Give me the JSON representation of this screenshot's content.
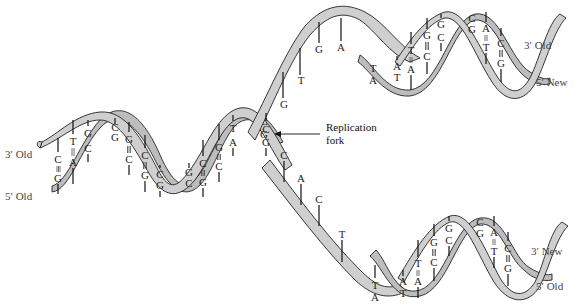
{
  "figure": {
    "type": "DNA replication fork diagram",
    "colors": {
      "ribbon": "#cfcfcf",
      "ribbon_shadow": "#bdbdbd",
      "outline": "#222222",
      "background": "#ffffff"
    }
  },
  "labels": {
    "left_top": "3′ Old",
    "left_bottom": "5′ Old",
    "right_upper_top": "3′ Old",
    "right_upper_bottom": "5′ New",
    "right_lower_top": "3′ New",
    "right_lower_bottom": "5′ Old",
    "fork_line1": "Replication",
    "fork_line2": "fork"
  },
  "parental_helix": {
    "pairs": [
      {
        "top": "C",
        "bottom": "G",
        "bond": "triple"
      },
      {
        "top": "T",
        "bottom": "A",
        "bond": "double"
      },
      {
        "top": "G",
        "bottom": "C",
        "bond": "triple"
      },
      {
        "top": "C",
        "bottom": "G",
        "bond": "triple"
      },
      {
        "top": "G",
        "bottom": "C",
        "bond": "triple"
      },
      {
        "top": "C",
        "bottom": "G",
        "bond": "triple"
      },
      {
        "top": "C",
        "bottom": "G",
        "bond": "triple"
      },
      {
        "top": "G",
        "bottom": "C",
        "bond": "triple"
      },
      {
        "top": "C",
        "bottom": "G",
        "bond": "triple"
      },
      {
        "top": "G",
        "bottom": "C",
        "bond": "triple"
      },
      {
        "top": "T",
        "bottom": "A",
        "bond": "double"
      },
      {
        "top": "C",
        "bottom": "G",
        "bond": "triple"
      }
    ]
  },
  "fork_pair": {
    "top": "C",
    "bottom": "G"
  },
  "upper_single_strand": [
    "G",
    "T",
    "G",
    "A"
  ],
  "lower_single_strand": [
    "C",
    "A",
    "C",
    "T"
  ],
  "upper_daughter_helix": {
    "pairs": [
      {
        "top": "T",
        "bottom": "A"
      },
      {
        "top": "A",
        "bottom": "T"
      },
      {
        "top": "T",
        "bottom": "A"
      },
      {
        "top": "G",
        "bottom": "C"
      },
      {
        "top": "G",
        "bottom": "C"
      },
      {
        "top": "C",
        "bottom": "G"
      },
      {
        "top": "A",
        "bottom": "T"
      },
      {
        "top": "C",
        "bottom": "G"
      }
    ]
  },
  "lower_daughter_helix": {
    "pairs": [
      {
        "top": "T",
        "bottom": "A"
      },
      {
        "top": "A",
        "bottom": "T"
      },
      {
        "top": "T",
        "bottom": "A"
      },
      {
        "top": "G",
        "bottom": "C"
      },
      {
        "top": "G",
        "bottom": "C"
      },
      {
        "top": "C",
        "bottom": "G"
      },
      {
        "top": "A",
        "bottom": "T"
      },
      {
        "top": "C",
        "bottom": "G"
      }
    ]
  }
}
